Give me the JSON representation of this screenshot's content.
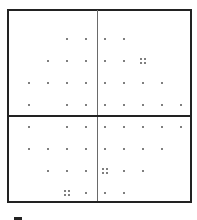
{
  "board": {
    "columns_x": [
      29,
      48,
      67,
      86,
      105,
      124,
      143,
      162,
      181
    ],
    "rows_y": [
      39,
      61,
      83,
      105,
      127,
      149,
      171,
      193
    ],
    "colors": {
      "frame": "#222222",
      "vertical_divider": "#6a6a6a",
      "horizontal_divider": "#222222",
      "dot": "#555555",
      "background": "#ffffff"
    },
    "dots": [
      [
        0,
        0,
        1,
        1,
        1,
        1,
        0,
        0,
        0
      ],
      [
        0,
        1,
        1,
        1,
        1,
        1,
        0,
        0,
        0
      ],
      [
        1,
        1,
        1,
        1,
        1,
        1,
        1,
        1,
        0
      ],
      [
        1,
        0,
        1,
        1,
        1,
        1,
        1,
        1,
        1
      ],
      [
        1,
        0,
        1,
        1,
        1,
        1,
        1,
        1,
        1
      ],
      [
        1,
        1,
        1,
        1,
        1,
        1,
        1,
        1,
        0
      ],
      [
        0,
        1,
        1,
        1,
        0,
        1,
        1,
        0,
        0
      ],
      [
        0,
        0,
        0,
        1,
        1,
        1,
        0,
        0,
        0
      ]
    ],
    "clusters": [
      {
        "row": 1,
        "col": 6
      },
      {
        "row": 6,
        "col": 4
      },
      {
        "row": 7,
        "col": 2
      }
    ]
  }
}
